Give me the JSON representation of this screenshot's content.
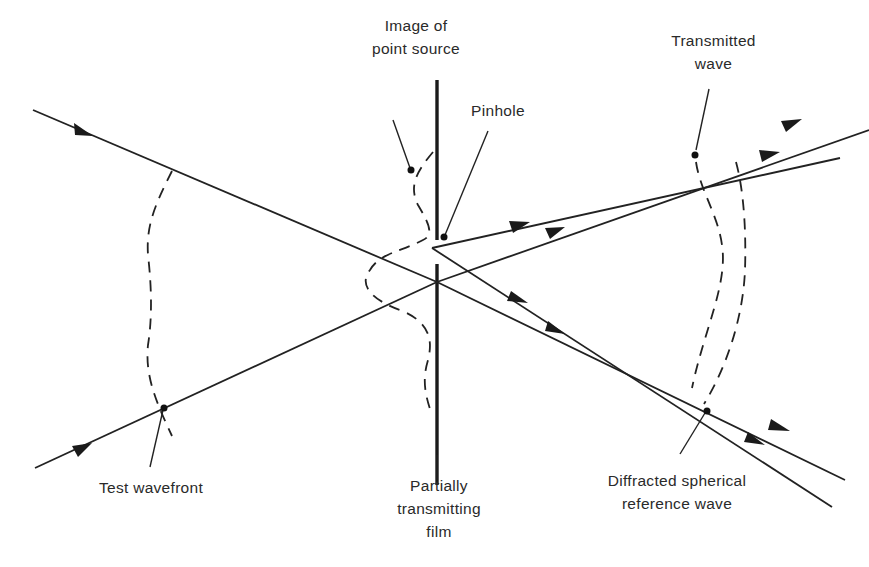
{
  "figure": {
    "type": "optical-schematic",
    "background_color": "#ffffff",
    "line_color": "#222222"
  },
  "labels": {
    "image_of_point_source": {
      "line1": "Image of",
      "line2": "point source"
    },
    "pinhole": {
      "line1": "Pinhole"
    },
    "transmitted_wave": {
      "line1": "Transmitted",
      "line2": "wave"
    },
    "test_wavefront": {
      "line1": "Test wavefront"
    },
    "partially_transmitting_film": {
      "line1": "Partially",
      "line2": "transmitting",
      "line3": "film"
    },
    "diffracted_reference_wave": {
      "line1": "Diffracted spherical",
      "line2": "reference wave"
    }
  },
  "elements": {
    "incoming_rays": [
      {
        "name": "upper-incoming-ray",
        "from": [
          33,
          110
        ],
        "to": [
          437,
          282
        ]
      },
      {
        "name": "lower-incoming-ray",
        "from": [
          35,
          468
        ],
        "to": [
          437,
          282
        ]
      }
    ],
    "transmitted_rays": [
      {
        "name": "transmitted-ray-upper",
        "from": [
          437,
          282
        ],
        "to": [
          869,
          130
        ]
      },
      {
        "name": "transmitted-ray-lower",
        "from": [
          437,
          282
        ],
        "to": [
          845,
          480
        ]
      }
    ],
    "diffracted_rays": [
      {
        "name": "diffracted-ray-upper",
        "from": [
          432,
          248
        ],
        "to": [
          840,
          158
        ]
      },
      {
        "name": "diffracted-ray-lower",
        "from": [
          432,
          248
        ],
        "to": [
          832,
          507
        ]
      }
    ],
    "film": {
      "x": 437,
      "top": 80,
      "bottom": 485,
      "pinhole_gap": [
        240,
        264
      ]
    }
  }
}
